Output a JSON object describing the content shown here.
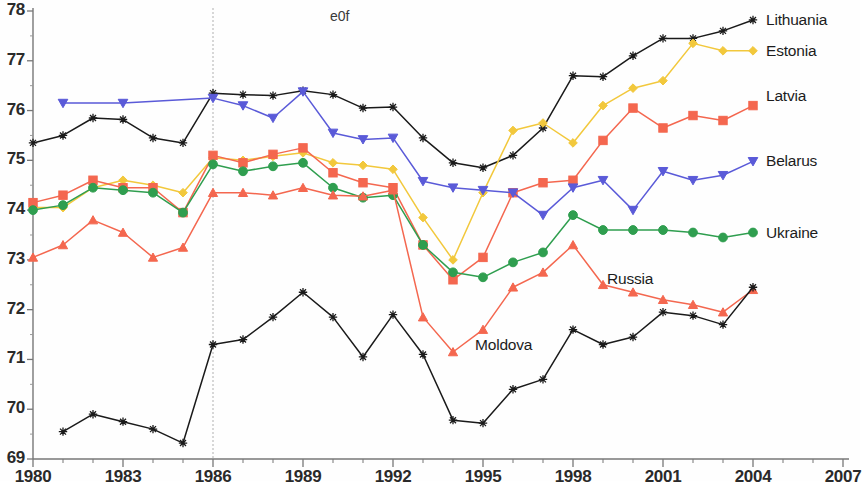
{
  "chart_data": {
    "type": "line",
    "title": "e0f",
    "xlabel": "",
    "ylabel": "",
    "xlim": [
      1980,
      2007
    ],
    "ylim": [
      69,
      78
    ],
    "ytick_labels": [
      "69",
      "70",
      "71",
      "72",
      "73",
      "74",
      "75",
      "76",
      "77",
      "78"
    ],
    "ytick_values": [
      69,
      70,
      71,
      72,
      73,
      74,
      75,
      76,
      77,
      78
    ],
    "xtick_labels": [
      "1980",
      "1983",
      "1986",
      "1989",
      "1992",
      "1995",
      "1998",
      "2001",
      "2004",
      "2007"
    ],
    "xtick_values": [
      1980,
      1983,
      1986,
      1989,
      1992,
      1995,
      1998,
      2001,
      2004,
      2007
    ],
    "grid": false,
    "legend": "inline-right",
    "annotations": [
      {
        "type": "vertical-line",
        "x": 1986,
        "style": "dashed",
        "color": "#b0b0b0"
      }
    ],
    "series": [
      {
        "name": "Lithuania",
        "color": "#1a1a1a",
        "marker": "star",
        "label_x": 2004.3,
        "label_y": 77.82,
        "x": [
          1980,
          1981,
          1982,
          1983,
          1984,
          1985,
          1986,
          1987,
          1988,
          1989,
          1990,
          1991,
          1992,
          1993,
          1994,
          1995,
          1996,
          1997,
          1998,
          1999,
          2000,
          2001,
          2002,
          2003,
          2004
        ],
        "values": [
          75.35,
          75.5,
          75.85,
          75.82,
          75.45,
          75.35,
          76.35,
          76.32,
          76.3,
          76.4,
          76.32,
          76.05,
          76.07,
          75.45,
          74.95,
          74.85,
          75.1,
          75.65,
          76.7,
          76.68,
          77.1,
          77.45,
          77.45,
          77.6,
          77.82
        ]
      },
      {
        "name": "Estonia",
        "color": "#f2c83c",
        "marker": "diamond",
        "label_x": 2004.3,
        "label_y": 77.2,
        "x": [
          1980,
          1981,
          1982,
          1983,
          1984,
          1985,
          1986,
          1987,
          1988,
          1989,
          1990,
          1991,
          1992,
          1993,
          1994,
          1995,
          1996,
          1997,
          1998,
          1999,
          2000,
          2001,
          2002,
          2003,
          2004
        ],
        "values": [
          74.05,
          74.05,
          74.45,
          74.6,
          74.5,
          74.35,
          75.05,
          75.0,
          75.08,
          75.15,
          74.95,
          74.9,
          74.82,
          73.85,
          73.0,
          74.35,
          75.6,
          75.75,
          75.35,
          76.1,
          76.45,
          76.6,
          77.35,
          77.2,
          77.2
        ]
      },
      {
        "name": "Latvia",
        "color": "#f4674f",
        "marker": "square",
        "label_x": 2004.3,
        "label_y": 76.3,
        "x": [
          1980,
          1981,
          1982,
          1983,
          1984,
          1985,
          1986,
          1987,
          1988,
          1989,
          1990,
          1991,
          1992,
          1993,
          1994,
          1995,
          1996,
          1997,
          1998,
          1999,
          2000,
          2001,
          2002,
          2003,
          2004
        ],
        "values": [
          74.15,
          74.3,
          74.6,
          74.45,
          74.45,
          73.95,
          75.1,
          74.95,
          75.12,
          75.25,
          74.75,
          74.55,
          74.45,
          73.3,
          72.6,
          73.05,
          74.35,
          74.55,
          74.6,
          75.4,
          76.05,
          75.65,
          75.9,
          75.8,
          76.1
        ]
      },
      {
        "name": "Belarus",
        "color": "#5a5ad8",
        "marker": "triangle-down",
        "label_x": 2004.3,
        "label_y": 74.98,
        "x": [
          1981,
          1983,
          1986,
          1987,
          1988,
          1989,
          1990,
          1991,
          1992,
          1993,
          1994,
          1995,
          1996,
          1997,
          1998,
          1999,
          2000,
          2001,
          2002,
          2003,
          2004
        ],
        "values": [
          76.15,
          76.15,
          76.25,
          76.1,
          75.85,
          76.38,
          75.55,
          75.42,
          75.45,
          74.58,
          74.45,
          74.4,
          74.35,
          73.9,
          74.45,
          74.6,
          74.0,
          74.78,
          74.6,
          74.7,
          74.98
        ]
      },
      {
        "name": "Ukraine",
        "color": "#2f9e4f",
        "marker": "circle",
        "label_x": 2004.3,
        "label_y": 73.55,
        "x": [
          1980,
          1981,
          1982,
          1983,
          1984,
          1985,
          1986,
          1987,
          1988,
          1989,
          1990,
          1991,
          1992,
          1993,
          1994,
          1995,
          1996,
          1997,
          1998,
          1999,
          2000,
          2001,
          2002,
          2003,
          2004
        ],
        "values": [
          74.0,
          74.1,
          74.45,
          74.4,
          74.35,
          73.95,
          74.92,
          74.78,
          74.88,
          74.95,
          74.45,
          74.25,
          74.3,
          73.3,
          72.75,
          72.65,
          72.95,
          73.15,
          73.9,
          73.6,
          73.6,
          73.6,
          73.55,
          73.45,
          73.55
        ]
      },
      {
        "name": "Russia",
        "color": "#f4674f",
        "marker": "triangle-up",
        "label_x": 1999.0,
        "label_y": 72.62,
        "x": [
          1980,
          1981,
          1982,
          1983,
          1984,
          1985,
          1986,
          1987,
          1988,
          1989,
          1990,
          1991,
          1992,
          1993,
          1994,
          1995,
          1996,
          1997,
          1998,
          1999,
          2000,
          2001,
          2002,
          2003,
          2004
        ],
        "values": [
          73.05,
          73.3,
          73.8,
          73.55,
          73.05,
          73.25,
          74.35,
          74.35,
          74.3,
          74.45,
          74.3,
          74.28,
          74.4,
          71.85,
          71.15,
          71.6,
          72.45,
          72.75,
          73.3,
          72.5,
          72.35,
          72.2,
          72.1,
          71.95,
          72.4
        ]
      },
      {
        "name": "Moldova",
        "color": "#1a1a1a",
        "marker": "star",
        "label_x": 1994.6,
        "label_y": 71.3,
        "x": [
          1981,
          1982,
          1983,
          1984,
          1985,
          1986,
          1987,
          1988,
          1989,
          1990,
          1991,
          1992,
          1993,
          1994,
          1995,
          1996,
          1997,
          1998,
          1999,
          2000,
          2001,
          2002,
          2003,
          2004
        ],
        "values": [
          69.55,
          69.9,
          69.75,
          69.6,
          69.32,
          71.3,
          71.4,
          71.85,
          72.35,
          71.85,
          71.05,
          71.9,
          71.1,
          69.78,
          69.72,
          70.4,
          70.6,
          71.6,
          71.3,
          71.45,
          71.95,
          71.88,
          71.7,
          72.45
        ]
      }
    ]
  }
}
